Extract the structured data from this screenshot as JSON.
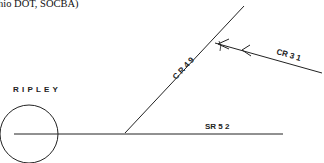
{
  "caption": "hio DOT, SOCBA)",
  "town": {
    "label": "RIPLEY"
  },
  "roads": [
    {
      "id": "sr52",
      "label": "SR  5 2",
      "type": "state-route"
    },
    {
      "id": "cr49",
      "label": "C R   4 9",
      "type": "county-road"
    },
    {
      "id": "cr31",
      "label": "CR    3 1",
      "type": "county-road"
    }
  ],
  "colors": {
    "line": "#222222",
    "background": "#ffffff"
  }
}
